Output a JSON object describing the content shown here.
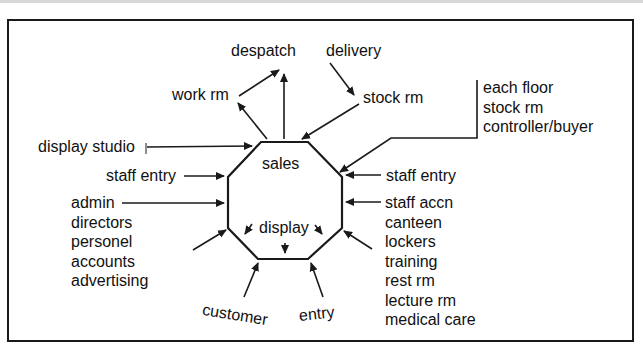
{
  "diagram": {
    "center": {
      "top_label": "sales",
      "bottom_label": "display"
    },
    "labels": {
      "despatch": "despatch",
      "delivery": "delivery",
      "work_rm": "work rm",
      "stock_rm": "stock rm",
      "display_studio": "display studio",
      "staff_entry_left": "staff entry",
      "staff_entry_right": "staff entry",
      "customer": "customer",
      "entry": "entry"
    },
    "floor_group": [
      "each floor",
      "stock rm",
      "controller/buyer"
    ],
    "admin_group": [
      "admin",
      "directors",
      "personel",
      "accounts",
      "advertising"
    ],
    "staff_group": [
      "staff accn",
      "canteen",
      "lockers",
      "training",
      "rest rm",
      "lecture rm",
      "medical care"
    ],
    "colors": {
      "line": "#1a1a1a",
      "background": "#ffffff"
    }
  }
}
